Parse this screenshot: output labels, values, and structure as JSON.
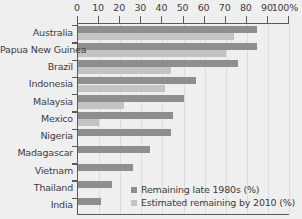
{
  "chart_data": {
    "type": "bar",
    "orientation": "horizontal",
    "title": "",
    "subtitle": "",
    "xlabel": "",
    "ylabel": "",
    "xlim": [
      0,
      100
    ],
    "xticks": [
      0,
      10,
      20,
      30,
      40,
      50,
      60,
      70,
      80,
      90,
      100
    ],
    "xtick_labels": [
      "0",
      "10",
      "20",
      "30",
      "40",
      "50",
      "60",
      "70",
      "80",
      "90",
      "100%"
    ],
    "grid": true,
    "grid_axis": "x",
    "legend_position": "bottom-right",
    "categories": [
      "Australia",
      "Papua New Guinea",
      "Brazil",
      "Indonesia",
      "Malaysia",
      "Mexico",
      "Nigeria",
      "Madagascar",
      "Vietnam",
      "Thailand",
      "India"
    ],
    "series": [
      {
        "name": "Remaining late 1980s (%)",
        "color": "#8e8e8e",
        "values": [
          85,
          85,
          76,
          56,
          50,
          45,
          44,
          34,
          26,
          16,
          11
        ]
      },
      {
        "name": "Estimated remaining by 2010 (%)",
        "color": "#c3c3c3",
        "values": [
          74,
          70,
          44,
          41,
          22,
          10,
          0,
          0,
          0,
          0,
          0
        ]
      }
    ]
  },
  "legend": {
    "items": [
      {
        "label": "Remaining late 1980s (%)",
        "color": "#8e8e8e"
      },
      {
        "label": "Estimated remaining by 2010 (%)",
        "color": "#c3c3c3"
      }
    ]
  },
  "colors": {
    "background": "#efefef",
    "axis": "#5a5a5a",
    "grid": "#dcdcdc",
    "text": "#3c3c3c",
    "series_1": "#8e8e8e",
    "series_2": "#c3c3c3"
  }
}
